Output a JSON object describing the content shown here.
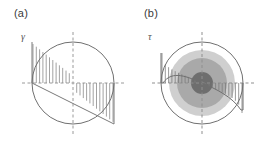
{
  "figure": {
    "background_color": "#ffffff",
    "line_color": "#6f6f6f",
    "axis_color": "#8c8c8c",
    "hatch_color": "#8a8a8a",
    "width": 260,
    "height": 144
  },
  "panels": [
    {
      "id": "a",
      "label": "(a)",
      "quantity_symbol": "γ",
      "quantity_name": "shear-strain",
      "description": "Circular cross-section with linear antisymmetric distribution across the diameter",
      "geometry": {
        "center_x": 73,
        "center_y": 83,
        "radius": 41,
        "profile_amplitude": 41,
        "hatch_count_left": 12,
        "hatch_count_right": 12
      },
      "distribution": {
        "type": "linear",
        "x_normalized": [
          -1,
          -0.75,
          -0.5,
          -0.25,
          0,
          0.25,
          0.5,
          0.75,
          1
        ],
        "value_normalized": [
          1,
          0.75,
          0.5,
          0.25,
          0,
          -0.25,
          -0.5,
          -0.75,
          -1
        ]
      },
      "shading_rings": []
    },
    {
      "id": "b",
      "label": "(b)",
      "quantity_symbol": "τ",
      "quantity_name": "shear-stress",
      "description": "Circular cross-section with concentric material zones and a nonlinear antisymmetric distribution",
      "geometry": {
        "center_x": 72,
        "center_y": 83,
        "radius": 41,
        "profile_amplitude": 30,
        "hatch_count_left": 12,
        "hatch_count_right": 12
      },
      "distribution": {
        "type": "nonlinear",
        "x_normalized": [
          -1,
          -0.85,
          -0.7,
          -0.55,
          -0.4,
          -0.25,
          0,
          0.25,
          0.4,
          0.55,
          0.7,
          0.85,
          1
        ],
        "value_normalized": [
          1,
          0.62,
          0.46,
          0.36,
          0.27,
          0.17,
          0,
          -0.17,
          -0.27,
          -0.36,
          -0.46,
          -0.62,
          -1
        ]
      },
      "shading_rings": [
        {
          "name": "outer-zone",
          "radius": 33,
          "color": "#cfcfcf"
        },
        {
          "name": "middle-zone",
          "radius": 25,
          "color": "#a9a9a9"
        },
        {
          "name": "core-zone",
          "radius": 11,
          "color": "#6e6e6e"
        }
      ]
    }
  ]
}
